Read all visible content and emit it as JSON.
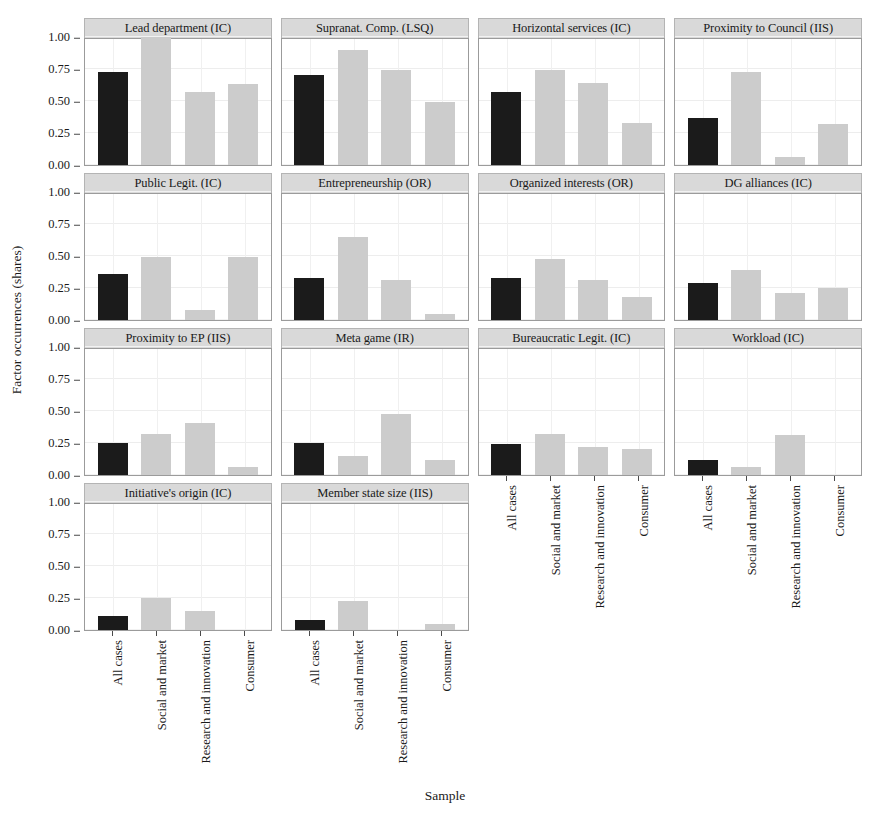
{
  "chart_data": {
    "type": "bar",
    "title": "",
    "xlabel": "Sample",
    "ylabel": "Factor occurrences (shares)",
    "ylim": [
      0,
      1
    ],
    "yticks": [
      "0.00",
      "0.25",
      "0.50",
      "0.75",
      "1.00"
    ],
    "ytick_values": [
      0,
      0.25,
      0.5,
      0.75,
      1
    ],
    "categories": [
      "All cases",
      "Social and market",
      "Research and innovation",
      "Consumer"
    ],
    "grid": true,
    "legend": "none",
    "facet_layout": {
      "columns": 4,
      "rows": 4
    },
    "colors": {
      "all_cases_bar": "#1b1b1b",
      "other_bars": "#cccccc",
      "strip_background": "#d9d9d9",
      "panel_border": "#9b9b9b"
    },
    "panels": [
      {
        "title": "Lead department (IC)",
        "values": [
          0.73,
          1.0,
          0.57,
          0.63
        ]
      },
      {
        "title": "Supranat. Comp. (LSQ)",
        "values": [
          0.7,
          0.9,
          0.74,
          0.49
        ]
      },
      {
        "title": "Horizontal services (IC)",
        "values": [
          0.57,
          0.74,
          0.64,
          0.33
        ]
      },
      {
        "title": "Proximity to Council (IIS)",
        "values": [
          0.37,
          0.73,
          0.06,
          0.32
        ]
      },
      {
        "title": "Public Legit. (IC)",
        "values": [
          0.36,
          0.49,
          0.08,
          0.49
        ]
      },
      {
        "title": "Entrepreneurship (OR)",
        "values": [
          0.33,
          0.65,
          0.31,
          0.05
        ]
      },
      {
        "title": "Organized interests (OR)",
        "values": [
          0.33,
          0.48,
          0.31,
          0.18
        ]
      },
      {
        "title": "DG alliances (IC)",
        "values": [
          0.29,
          0.39,
          0.21,
          0.25
        ]
      },
      {
        "title": "Proximity to EP (IIS)",
        "values": [
          0.25,
          0.32,
          0.41,
          0.06
        ]
      },
      {
        "title": "Meta game (IR)",
        "values": [
          0.25,
          0.15,
          0.48,
          0.12
        ]
      },
      {
        "title": "Bureaucratic Legit. (IC)",
        "values": [
          0.24,
          0.32,
          0.22,
          0.2
        ]
      },
      {
        "title": "Workload (IC)",
        "values": [
          0.12,
          0.06,
          0.31,
          0.0
        ]
      },
      {
        "title": "Initiative's origin (IC)",
        "values": [
          0.11,
          0.25,
          0.15,
          0.0
        ]
      },
      {
        "title": "Member state size (IIS)",
        "values": [
          0.08,
          0.23,
          0.0,
          0.05
        ]
      }
    ]
  }
}
